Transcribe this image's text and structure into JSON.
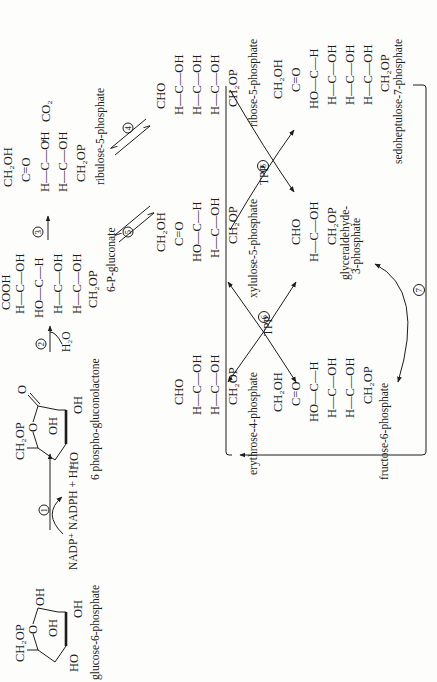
{
  "compounds": {
    "g6p": {
      "name": "glucose-6-phosphate",
      "ring": {
        "top": "CH2OP",
        "o": "O",
        "oh1": "OH",
        "ho": "HO",
        "oh2": "OH",
        "oh3": "OH"
      }
    },
    "lactone": {
      "name": "6 phospho-gluconolactone",
      "ring": {
        "top": "CH2OP",
        "o": "O",
        "carbonyl": "O",
        "oh1": "OH",
        "ho": "HO",
        "oh2": "OH"
      }
    },
    "gluconate": {
      "name": "6-P-gluconate",
      "rows": [
        "COOH",
        "H—C—OH",
        "HO—C—H",
        "H—C—OH",
        "H—C—OH",
        "CH2OP"
      ]
    },
    "ribulose5p": {
      "name": "ribulose-5-phosphate",
      "rows": [
        "CH2OH",
        "C=O",
        "H—C—OH",
        "H—C—OH",
        "CH2OP"
      ]
    },
    "co2": {
      "plus": "+",
      "formula": "CO2"
    },
    "ribose5p": {
      "name": "ribose-5-phosphate",
      "rows": [
        "CHO",
        "H—C—OH",
        "H—C—OH",
        "H—C—OH",
        "CH2OP"
      ]
    },
    "xylulose5p": {
      "name": "xylulose-5-phosphate",
      "rows": [
        "CH2OH",
        "C=O",
        "HO—C—H",
        "H—C—OH",
        "CH2OP"
      ]
    },
    "sedoheptulose7p": {
      "name": "sedoheptulose-7-phosphate",
      "rows": [
        "CH2OH",
        "C=O",
        "HO—C—H",
        "H—C—OH",
        "H—C—OH",
        "H—C—OH",
        "CH2OP"
      ]
    },
    "gap": {
      "name_line1": "glyceraldehyde-",
      "name_line2": "3-phosphate",
      "rows": [
        "CHO",
        "H—C—OH",
        "CH2OP"
      ]
    },
    "erythrose4p": {
      "name": "erythrose-4-phosphate",
      "rows": [
        "CHO",
        "H—C—OH",
        "H—C—OH",
        "CH2OP"
      ]
    },
    "fructose6p": {
      "name": "fructose-6-phosphate",
      "rows": [
        "CH2OH",
        "C=O",
        "HO—C—H",
        "H—C—OH",
        "H—C—OH",
        "CH2OP"
      ]
    }
  },
  "reactions": {
    "r1": {
      "number": "1",
      "cofactor_in": "NADP+",
      "cofactor_out": "NADPH + H+"
    },
    "r2": {
      "number": "2",
      "cofactor": "H2O"
    },
    "r3": {
      "number": "3"
    },
    "r4": {
      "number": "4"
    },
    "r5": {
      "number": "5"
    },
    "r6a": {
      "number": "6",
      "cofactor": "TPP"
    },
    "r6b": {
      "number": "6",
      "cofactor": "TPP"
    },
    "r7": {
      "number": "7"
    }
  }
}
